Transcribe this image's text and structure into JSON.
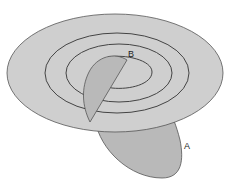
{
  "diagram": {
    "labels": {
      "a": "A",
      "b": "B"
    },
    "colors": {
      "plane_fill": "#cfcfcf",
      "plane_stroke": "#555555",
      "lobe_fill": "#b9b9b9",
      "ring_stroke": "#444444",
      "background": "#ffffff"
    }
  }
}
